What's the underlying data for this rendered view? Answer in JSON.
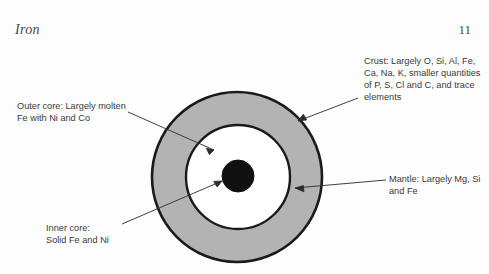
{
  "header": {
    "title": "Iron",
    "page_number": "11"
  },
  "diagram": {
    "name": "earth-internal-structure",
    "layers": [
      {
        "id": "crust",
        "name": "Crust",
        "color": "#b3b3b3",
        "stroke": "#1a1a1a",
        "cx": 237,
        "cy": 177,
        "r": 85
      },
      {
        "id": "outer-core",
        "name": "Outer core",
        "color": "#ffffff",
        "stroke": "#1a1a1a",
        "cx": 238,
        "cy": 177,
        "r": 52
      },
      {
        "id": "inner-core",
        "name": "Inner core",
        "color": "#111111",
        "stroke": "#111111",
        "cx": 238,
        "cy": 176,
        "r": 16
      }
    ]
  },
  "labels": {
    "crust": "Crust: Largely O, Si, Al, Fe, Ca, Na, K, smaller quantities of P, S, Cl and C, and trace elements",
    "outer_core": "Outer core: Largely molten Fe with Ni and Co",
    "inner_core": "Inner core:\nSolid Fe and Ni",
    "mantle": "Mantle: Largely Mg, Si and Fe"
  },
  "colors": {
    "crust_fill": "#b3b3b3",
    "outer_core_fill": "#ffffff",
    "inner_core_fill": "#111111",
    "outline": "#1a1a1a",
    "leader_line": "#2b2b2b",
    "text": "#3a3a3a",
    "page_background": "#fdfdfd"
  }
}
